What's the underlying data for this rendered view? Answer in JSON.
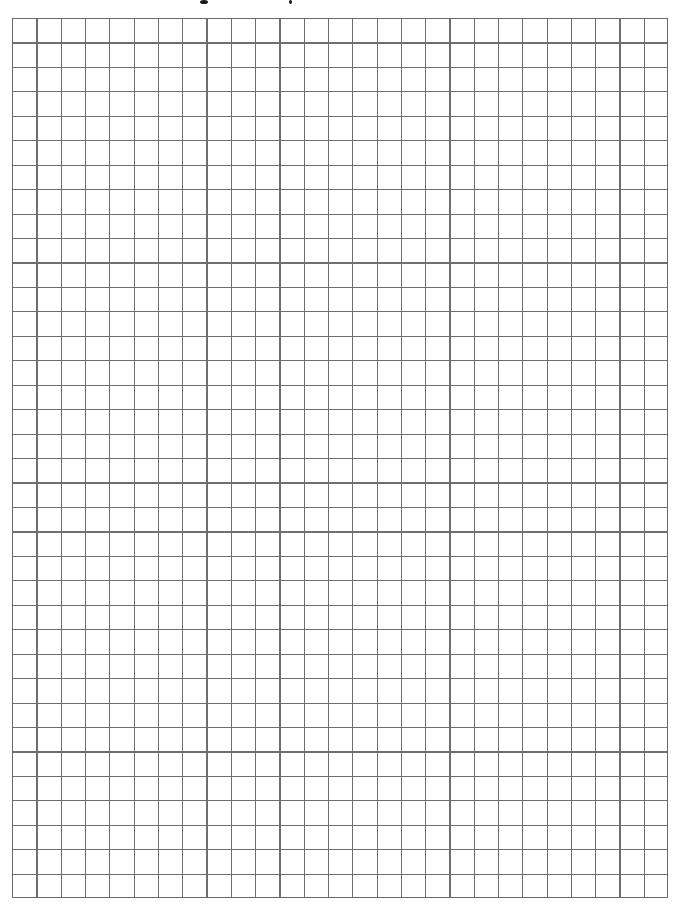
{
  "page": {
    "type": "graph-paper",
    "title_visible_fragment": "",
    "background_color": "#ffffff",
    "line_color": "#6e6e6e"
  },
  "grid": {
    "columns": 27,
    "rows": 36,
    "cell_width_px": 24.3,
    "cell_height_px": 24.45,
    "left_px": 11.7,
    "top_px": 17.5,
    "width_px": 656,
    "height_px": 880.2
  }
}
